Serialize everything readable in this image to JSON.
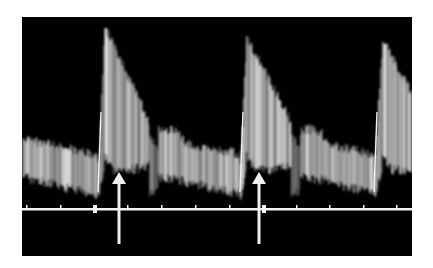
{
  "figure": {
    "background_color": "#000000",
    "signal_color": "#e8e8e8",
    "baseline_color": "#f2f2f2",
    "arrow_color": "#efefef"
  },
  "panel": {
    "x": 22,
    "y": 17,
    "width": 390,
    "height": 239
  },
  "baseline": {
    "y": 192,
    "ticks_x": [
      4,
      38,
      105,
      139,
      173,
      207,
      274,
      307,
      341,
      374
    ],
    "markers_x": [
      71,
      240
    ]
  },
  "arrows": [
    {
      "label": "arrow-1",
      "x": 97,
      "tip_y": 155,
      "bottom_y": 227
    },
    {
      "label": "arrow-2",
      "x": 237,
      "tip_y": 155,
      "bottom_y": 227
    }
  ],
  "waveform": {
    "cycles": [
      {
        "upstroke_x": 76,
        "peak_x": 82,
        "peak_y": 10
      },
      {
        "upstroke_x": 218,
        "peak_x": 224,
        "peak_y": 20
      },
      {
        "upstroke_x": 352,
        "peak_x": 360,
        "peak_y": 22
      }
    ]
  }
}
